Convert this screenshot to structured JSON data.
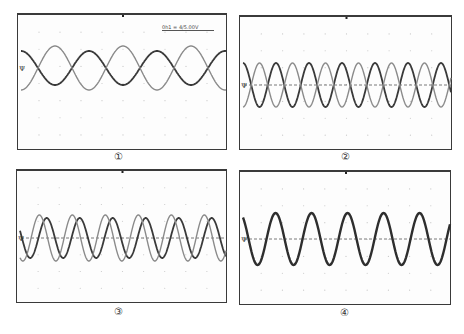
{
  "figure": {
    "panels": [
      {
        "id": 1,
        "caption": "①",
        "readout": "0h1 = 4/5.00V",
        "box": {
          "x": 17,
          "y": 13,
          "w": 210,
          "h": 137
        },
        "center_y": 53,
        "midline_dashed": false,
        "marker": "Ψ",
        "waves": [
          {
            "name": "trace-a",
            "color": "#3a3a3a",
            "amplitude": 17,
            "period": 68,
            "phase": 0,
            "width": 1.8
          },
          {
            "name": "trace-b",
            "color": "#8a8a8a",
            "amplitude": 22,
            "period": 68,
            "phase": 3.14159,
            "width": 1.4
          }
        ]
      },
      {
        "id": 2,
        "caption": "②",
        "readout": "",
        "box": {
          "x": 239,
          "y": 15,
          "w": 213,
          "h": 135
        },
        "center_y": 68,
        "midline_dashed": true,
        "marker": "Ψ",
        "waves": [
          {
            "name": "trace-a",
            "color": "#3a3a3a",
            "amplitude": 22,
            "period": 33,
            "phase": 0,
            "width": 1.8
          },
          {
            "name": "trace-b",
            "color": "#8a8a8a",
            "amplitude": 22,
            "period": 33,
            "phase": 3.14159,
            "width": 1.4
          }
        ]
      },
      {
        "id": 3,
        "caption": "③",
        "readout": "",
        "box": {
          "x": 16,
          "y": 169,
          "w": 211,
          "h": 134
        },
        "center_y": 67,
        "midline_dashed": true,
        "marker": "Ψ",
        "waves": [
          {
            "name": "trace-a",
            "color": "#3a3a3a",
            "amplitude": 20,
            "period": 33,
            "phase": 1.2,
            "width": 1.8
          },
          {
            "name": "trace-b",
            "color": "#8a8a8a",
            "amplitude": 23,
            "period": 33,
            "phase": 2.6,
            "width": 1.4
          }
        ]
      },
      {
        "id": 4,
        "caption": "④",
        "readout": "",
        "box": {
          "x": 239,
          "y": 170,
          "w": 212,
          "h": 135
        },
        "center_y": 67,
        "midline_dashed": true,
        "marker": "Ψ",
        "waves": [
          {
            "name": "trace-a",
            "color": "#2e2e2e",
            "amplitude": 26,
            "period": 36,
            "phase": 0.6,
            "width": 2.4
          }
        ]
      }
    ],
    "captions": [
      {
        "text": "①",
        "x": 118,
        "y": 151
      },
      {
        "text": "②",
        "x": 345,
        "y": 151
      },
      {
        "text": "③",
        "x": 118,
        "y": 306
      },
      {
        "text": "④",
        "x": 344,
        "y": 307
      }
    ]
  }
}
